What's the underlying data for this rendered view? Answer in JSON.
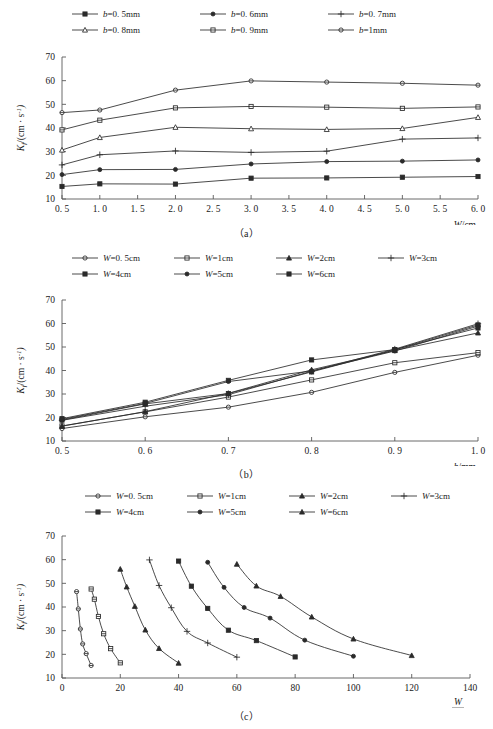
{
  "figure": {
    "panels": [
      {
        "id": "a",
        "caption": "（a）",
        "ylabel": "K_f/(cm · s⁻¹)",
        "xlabel": "W/cm",
        "ylabel_parts": {
          "sym": "K",
          "sub": "f",
          "rest": "/(cm · s",
          "sup": "-1",
          "tail": ")"
        },
        "legend": [
          {
            "label": "b=0. 5mm",
            "marker": "filled-square"
          },
          {
            "label": "b=0. 6mm",
            "marker": "filled-circle"
          },
          {
            "label": "b=0. 7mm",
            "marker": "plus"
          },
          {
            "label": "b=0. 8mm",
            "marker": "open-triangle"
          },
          {
            "label": "b=0. 9mm",
            "marker": "open-square"
          },
          {
            "label": "b=1mm",
            "marker": "open-circle"
          }
        ]
      },
      {
        "id": "b",
        "caption": "（b）",
        "xlabel": "b/mm",
        "legend": [
          {
            "label": "W=0. 5cm",
            "marker": "open-circle"
          },
          {
            "label": "W=1cm",
            "marker": "open-square"
          },
          {
            "label": "W=2cm",
            "marker": "filled-triangle"
          },
          {
            "label": "W=3cm",
            "marker": "plus"
          },
          {
            "label": "W=4cm",
            "marker": "filled-square"
          },
          {
            "label": "W=5cm",
            "marker": "filled-circle"
          },
          {
            "label": "W=6cm",
            "marker": "filled-square"
          }
        ]
      },
      {
        "id": "c",
        "caption": "（c）",
        "xlabel_num": "W",
        "xlabel_den": "b",
        "legend": [
          {
            "label": "W=0. 5cm",
            "marker": "open-circle"
          },
          {
            "label": "W=1cm",
            "marker": "open-square"
          },
          {
            "label": "W=2cm",
            "marker": "filled-triangle"
          },
          {
            "label": "W=3cm",
            "marker": "plus"
          },
          {
            "label": "W=4cm",
            "marker": "filled-square"
          },
          {
            "label": "W=5cm",
            "marker": "filled-circle"
          },
          {
            "label": "W=6cm",
            "marker": "filled-triangle"
          }
        ]
      }
    ]
  },
  "chart_data": [
    {
      "type": "line",
      "panel": "a",
      "title": "",
      "xlabel": "W/cm",
      "ylabel": "K_f/(cm · s⁻¹)",
      "xlim": [
        0.5,
        6.0
      ],
      "ylim": [
        10,
        70
      ],
      "xticks": [
        "0. 5",
        "1. 0",
        "1. 5",
        "2. 0",
        "2. 5",
        "3. 0",
        "3. 5",
        "4. 0",
        "4. 5",
        "5. 0",
        "5. 5",
        "6. 0"
      ],
      "xtick_values": [
        0.5,
        1.0,
        1.5,
        2.0,
        2.5,
        3.0,
        3.5,
        4.0,
        4.5,
        5.0,
        5.5,
        6.0
      ],
      "yticks": [
        "10",
        "20",
        "30",
        "40",
        "50",
        "60",
        "70"
      ],
      "ytick_values": [
        10,
        20,
        30,
        40,
        50,
        60,
        70
      ],
      "x": [
        0.5,
        1.0,
        2.0,
        3.0,
        4.0,
        5.0,
        6.0
      ],
      "grid": false,
      "legend_position": "top",
      "series": [
        {
          "name": "b=0. 5mm",
          "marker": "filled-square",
          "values": [
            15.3,
            16.4,
            16.3,
            18.8,
            18.9,
            19.2,
            19.5
          ]
        },
        {
          "name": "b=0. 6mm",
          "marker": "filled-circle",
          "values": [
            20.3,
            22.4,
            22.5,
            24.8,
            25.8,
            26.0,
            26.5
          ]
        },
        {
          "name": "b=0. 7mm",
          "marker": "plus",
          "values": [
            24.4,
            28.7,
            30.3,
            29.7,
            30.2,
            35.3,
            35.8
          ]
        },
        {
          "name": "b=0. 8mm",
          "marker": "open-triangle",
          "values": [
            30.7,
            36.0,
            40.3,
            39.7,
            39.4,
            39.8,
            44.5
          ]
        },
        {
          "name": "b=0. 9mm",
          "marker": "open-square",
          "values": [
            39.2,
            43.3,
            48.5,
            49.1,
            48.8,
            48.3,
            48.9
          ]
        },
        {
          "name": "b=1mm",
          "marker": "open-circle",
          "values": [
            46.5,
            47.6,
            56.0,
            59.9,
            59.4,
            58.9,
            58.1
          ]
        }
      ]
    },
    {
      "type": "line",
      "panel": "b",
      "title": "",
      "xlabel": "b/mm",
      "ylabel": "K_f/(cm · s⁻¹)",
      "xlim": [
        0.5,
        1.0
      ],
      "ylim": [
        10,
        70
      ],
      "xticks": [
        "0. 5",
        "0. 6",
        "0. 7",
        "0. 8",
        "0. 9",
        "1. 0"
      ],
      "xtick_values": [
        0.5,
        0.6,
        0.7,
        0.8,
        0.9,
        1.0
      ],
      "yticks": [
        "10",
        "20",
        "30",
        "40",
        "50",
        "60",
        "70"
      ],
      "ytick_values": [
        10,
        20,
        30,
        40,
        50,
        60,
        70
      ],
      "x": [
        0.5,
        0.6,
        0.7,
        0.8,
        0.9,
        1.0
      ],
      "grid": false,
      "legend_position": "top",
      "series": [
        {
          "name": "W=0. 5cm",
          "marker": "open-circle",
          "values": [
            15.3,
            20.3,
            24.4,
            30.7,
            39.2,
            46.5
          ]
        },
        {
          "name": "W=1cm",
          "marker": "open-square",
          "values": [
            16.4,
            22.4,
            28.7,
            36.0,
            43.3,
            47.6
          ]
        },
        {
          "name": "W=2cm",
          "marker": "filled-triangle",
          "values": [
            16.3,
            22.5,
            30.3,
            40.3,
            48.5,
            56.0
          ]
        },
        {
          "name": "W=3cm",
          "marker": "plus",
          "values": [
            18.8,
            24.8,
            29.7,
            39.7,
            49.1,
            59.9
          ]
        },
        {
          "name": "W=4cm",
          "marker": "filled-square",
          "values": [
            18.9,
            25.8,
            30.2,
            39.4,
            48.8,
            59.4
          ]
        },
        {
          "name": "W=5cm",
          "marker": "filled-circle",
          "values": [
            19.2,
            26.0,
            35.3,
            39.8,
            48.3,
            58.9
          ]
        },
        {
          "name": "W=6cm",
          "marker": "filled-square",
          "values": [
            19.5,
            26.5,
            35.8,
            44.5,
            48.9,
            58.1
          ]
        }
      ]
    },
    {
      "type": "line",
      "panel": "c",
      "title": "",
      "xlabel": "W/b",
      "ylabel": "K_f/(cm · s⁻¹)",
      "xlim": [
        0,
        140
      ],
      "ylim": [
        10,
        70
      ],
      "xticks": [
        "0",
        "20",
        "40",
        "60",
        "80",
        "100",
        "120",
        "140"
      ],
      "xtick_values": [
        0,
        20,
        40,
        60,
        80,
        100,
        120,
        140
      ],
      "yticks": [
        "10",
        "20",
        "30",
        "40",
        "50",
        "60",
        "70"
      ],
      "ytick_values": [
        10,
        20,
        30,
        40,
        50,
        60,
        70
      ],
      "grid": false,
      "legend_position": "top",
      "series": [
        {
          "name": "W=0. 5cm",
          "marker": "open-circle",
          "x": [
            5.0,
            5.6,
            6.3,
            7.1,
            8.3,
            10.0
          ],
          "values": [
            46.5,
            39.2,
            30.7,
            24.4,
            20.3,
            15.3
          ]
        },
        {
          "name": "W=1cm",
          "marker": "open-square",
          "x": [
            10.0,
            11.1,
            12.5,
            14.3,
            16.7,
            20.0
          ],
          "values": [
            47.6,
            43.3,
            36.0,
            28.7,
            22.4,
            16.4
          ]
        },
        {
          "name": "W=2cm",
          "marker": "filled-triangle",
          "x": [
            20.0,
            22.2,
            25.0,
            28.6,
            33.3,
            40.0
          ],
          "values": [
            56.0,
            48.5,
            40.3,
            30.3,
            22.5,
            16.3
          ]
        },
        {
          "name": "W=3cm",
          "marker": "plus",
          "x": [
            30.0,
            33.3,
            37.5,
            42.9,
            50.0,
            60.0
          ],
          "values": [
            59.9,
            49.1,
            39.7,
            29.7,
            24.8,
            18.8
          ]
        },
        {
          "name": "W=4cm",
          "marker": "filled-square",
          "x": [
            40.0,
            44.4,
            50.0,
            57.1,
            66.7,
            80.0
          ],
          "values": [
            59.4,
            48.8,
            39.4,
            30.2,
            25.8,
            18.9
          ]
        },
        {
          "name": "W=5cm",
          "marker": "filled-circle",
          "x": [
            50.0,
            55.6,
            62.5,
            71.4,
            83.3,
            100.0
          ],
          "values": [
            58.9,
            48.3,
            39.8,
            35.3,
            26.0,
            19.2
          ]
        },
        {
          "name": "W=6cm",
          "marker": "filled-triangle",
          "x": [
            60.0,
            66.7,
            75.0,
            85.7,
            100.0,
            120.0
          ],
          "values": [
            58.1,
            48.9,
            44.5,
            35.8,
            26.5,
            19.5
          ]
        }
      ]
    }
  ]
}
